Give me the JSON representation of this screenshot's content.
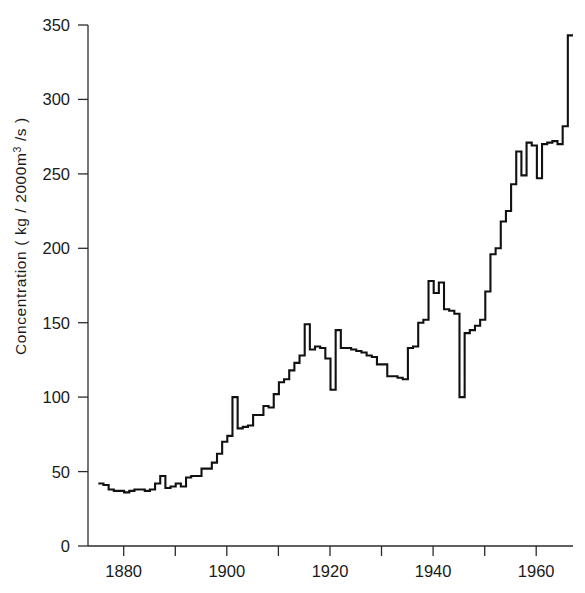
{
  "chart_data": {
    "type": "line",
    "subtype": "step-post",
    "title": "",
    "xlabel": "",
    "ylabel": "Concentration ( kg / 2000m3 /s )",
    "ylabel_parts": {
      "before": "Concentration ( kg / 2000m",
      "superscript": "3",
      "after": " /s )"
    },
    "xlim": [
      1873,
      1967
    ],
    "ylim": [
      0,
      350
    ],
    "yticks": [
      0,
      50,
      100,
      150,
      200,
      250,
      300,
      350
    ],
    "ytick_labels": [
      "0",
      "50",
      "100",
      "150",
      "200",
      "250",
      "300",
      "350"
    ],
    "xticks_major": [
      1880,
      1900,
      1920,
      1940,
      1960
    ],
    "xtick_labels": [
      "1880",
      "1900",
      "1920",
      "1940",
      "1960"
    ],
    "xticks_minor": [
      1890,
      1910,
      1930,
      1950
    ],
    "grid": false,
    "legend": null,
    "line_color": "#111111",
    "axis_color": "#2b2b2b",
    "background_color": "#ffffff",
    "x": [
      1875,
      1876,
      1877,
      1878,
      1879,
      1880,
      1881,
      1882,
      1883,
      1884,
      1885,
      1886,
      1887,
      1888,
      1889,
      1890,
      1891,
      1892,
      1893,
      1894,
      1895,
      1896,
      1897,
      1898,
      1899,
      1900,
      1901,
      1902,
      1903,
      1904,
      1905,
      1906,
      1907,
      1908,
      1909,
      1910,
      1911,
      1912,
      1913,
      1914,
      1915,
      1916,
      1917,
      1918,
      1919,
      1920,
      1921,
      1922,
      1923,
      1924,
      1925,
      1926,
      1927,
      1928,
      1929,
      1930,
      1931,
      1932,
      1933,
      1934,
      1935,
      1936,
      1937,
      1938,
      1939,
      1940,
      1941,
      1942,
      1943,
      1944,
      1945,
      1946,
      1947,
      1948,
      1949,
      1950,
      1951,
      1952,
      1953,
      1954,
      1955,
      1956,
      1957,
      1958,
      1959,
      1960,
      1961,
      1962,
      1963,
      1964,
      1965,
      1966
    ],
    "values": [
      42,
      41,
      38,
      37,
      37,
      36,
      37,
      38,
      38,
      37,
      38,
      42,
      47,
      39,
      40,
      42,
      40,
      46,
      47,
      47,
      52,
      52,
      56,
      62,
      70,
      74,
      100,
      79,
      80,
      81,
      88,
      88,
      94,
      93,
      102,
      110,
      112,
      118,
      123,
      128,
      149,
      132,
      134,
      133,
      126,
      105,
      145,
      133,
      133,
      132,
      131,
      130,
      128,
      127,
      122,
      122,
      114,
      114,
      113,
      112,
      133,
      134,
      150,
      152,
      178,
      170,
      177,
      159,
      158,
      156,
      100,
      143,
      145,
      148,
      152,
      171,
      196,
      200,
      218,
      225,
      243,
      265,
      249,
      271,
      269,
      247,
      270,
      271,
      272,
      270,
      282,
      343
    ],
    "annotations": []
  }
}
